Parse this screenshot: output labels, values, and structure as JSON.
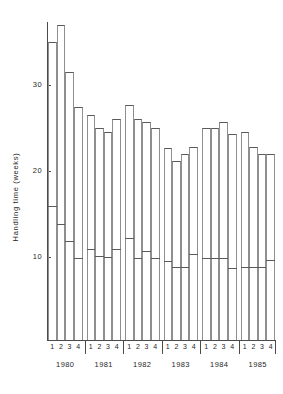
{
  "chart_data": {
    "type": "bar",
    "title": "",
    "subtitle": "",
    "xlabel": "",
    "ylabel": "Handling time (weeks)",
    "ylim": [
      0,
      38
    ],
    "yticks": [
      10,
      20,
      30
    ],
    "ytick_labels": [
      "10",
      "20",
      "30"
    ],
    "grid": false,
    "legend": null,
    "legend_position": "none",
    "note": "Each quarter is drawn as an open column spanning a range; the short horizontal rule inside each column marks a lower value (e.g. a median or minimum).",
    "x_group_label": "year",
    "x_subgroup_label": "quarter",
    "quarter_labels": [
      "1",
      "2",
      "3",
      "4"
    ],
    "years": [
      "1980",
      "1981",
      "1982",
      "1983",
      "1984",
      "1985"
    ],
    "categories": [
      "1980 Q1",
      "1980 Q2",
      "1980 Q3",
      "1980 Q4",
      "1981 Q1",
      "1981 Q2",
      "1981 Q3",
      "1981 Q4",
      "1982 Q1",
      "1982 Q2",
      "1982 Q3",
      "1982 Q4",
      "1983 Q1",
      "1983 Q2",
      "1983 Q3",
      "1983 Q4",
      "1984 Q1",
      "1984 Q2",
      "1984 Q3",
      "1984 Q4",
      "1985 Q1",
      "1985 Q2",
      "1985 Q3",
      "1985 Q4"
    ],
    "series": [
      {
        "name": "Column top (upper handling time)",
        "values": [
          35.0,
          37.0,
          31.5,
          27.5,
          26.5,
          25.0,
          24.5,
          26.0,
          27.7,
          26.0,
          25.7,
          25.0,
          22.7,
          21.2,
          22.0,
          22.8,
          25.0,
          25.0,
          25.7,
          24.3,
          24.5,
          22.8,
          22.0,
          22.0
        ]
      },
      {
        "name": "Inner rule (lower handling time)",
        "values": [
          16.0,
          14.0,
          12.0,
          10.0,
          11.0,
          10.2,
          10.1,
          11.0,
          12.3,
          10.0,
          10.8,
          10.0,
          9.6,
          9.0,
          9.0,
          10.5,
          10.0,
          10.0,
          10.0,
          8.8,
          9.0,
          9.0,
          9.0,
          9.8
        ]
      }
    ],
    "values": [
      35.0,
      37.0,
      31.5,
      27.5,
      26.5,
      25.0,
      24.5,
      26.0,
      27.7,
      26.0,
      25.7,
      25.0,
      22.7,
      21.2,
      22.0,
      22.8,
      25.0,
      25.0,
      25.7,
      24.3,
      24.5,
      22.8,
      22.0,
      22.0
    ],
    "colors": {
      "axis": "#4a4a4a",
      "bar_outline": "#8f8f8f",
      "bar_top": "#5a5a5a",
      "bar_fill": "#ffffff",
      "text": "#1f1f1f",
      "background": "#ffffff"
    }
  }
}
